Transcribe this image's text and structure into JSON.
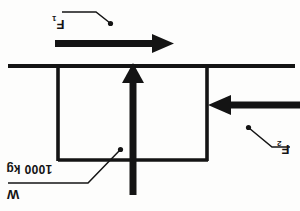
{
  "figure": {
    "type": "free-body-diagram",
    "orientation_note": "scanned upside-down",
    "ink_color": "#141414",
    "background_color": "#fdfdfc"
  },
  "labels": {
    "force_top": "F",
    "force_top_sub": "1",
    "force_right": "F",
    "force_right_sub": "2",
    "mass": "1000 kg",
    "weight": "W"
  },
  "forces": [
    {
      "name": "F1",
      "label": "F",
      "subscript": "1",
      "direction": "right",
      "applied_at": "top-surface",
      "arrow": {
        "x1": 55,
        "y1": 43,
        "x2": 170,
        "y2": 43
      }
    },
    {
      "name": "F2",
      "label": "F",
      "subscript": "2",
      "direction": "left",
      "applied_at": "right-side",
      "arrow": {
        "x1": 297,
        "y1": 105,
        "x2": 208,
        "y2": 105
      }
    },
    {
      "name": "W",
      "label": "W",
      "subscript": "",
      "direction": "up",
      "applied_at": "body-center",
      "arrow": {
        "x1": 133,
        "y1": 192,
        "x2": 133,
        "y2": 66
      }
    }
  ],
  "geometry": {
    "ground_line": {
      "x1": 8,
      "y1": 66,
      "x2": 295,
      "y2": 66
    },
    "block": {
      "x": 57,
      "y": 66,
      "width": 151,
      "height": 95
    }
  },
  "leaders": {
    "f1": [
      [
        70,
        13
      ],
      [
        96,
        13
      ],
      [
        110,
        24
      ]
    ],
    "f2": [
      [
        247,
        147
      ],
      [
        275,
        147
      ],
      [
        253,
        126
      ]
    ],
    "mass": [
      [
        10,
        182
      ],
      [
        88,
        182
      ],
      [
        121,
        149
      ]
    ]
  }
}
